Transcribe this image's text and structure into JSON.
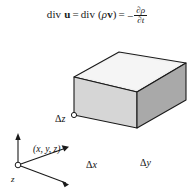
{
  "figure": {
    "caption_equation": {
      "lhs_div": "div",
      "lhs_vector": "u",
      "equals_1": "=",
      "mid_div": "div",
      "mid_open": "(",
      "mid_rho": "ρ",
      "mid_vector": "v",
      "mid_close": ")",
      "equals_2": "=",
      "minus": "−",
      "fraction_numerator": "∂ρ",
      "fraction_denominator": "∂t",
      "full_text": "div u = div (ρv) = −∂ρ/∂t"
    },
    "box": {
      "label_delta_z": {
        "symbol": "Δ",
        "variable": "z"
      },
      "label_delta_x": {
        "symbol": "Δ",
        "variable": "x"
      },
      "label_delta_y": {
        "symbol": "Δ",
        "variable": "y"
      },
      "corner_point": "(x, y, z)"
    },
    "axes": {
      "z_label": "z",
      "y_label": "y",
      "x_label": "x"
    },
    "colors": {
      "top_face": "#efefef",
      "front_face": "#d6d6d6",
      "right_face": "#a9a9a9",
      "outline": "#1a1a1a",
      "text": "#111111",
      "background": "#ffffff"
    }
  }
}
